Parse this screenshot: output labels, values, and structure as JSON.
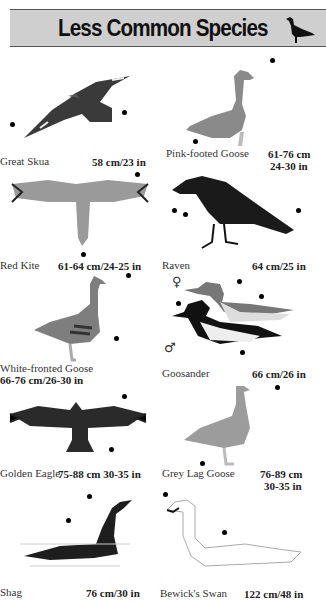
{
  "header": {
    "title": "Less Common Species",
    "icon": "goose-silhouette-icon",
    "background": "#cfcfcf"
  },
  "species": [
    {
      "name": "Great Skua",
      "size": "58 cm/23 in"
    },
    {
      "name": "Pink-footed Goose",
      "size_line1": "61-76 cm",
      "size_line2": "24-30 in"
    },
    {
      "name": "Red Kite",
      "size": "61-64 cm/24-25 in"
    },
    {
      "name": "Raven",
      "size": "64 cm/25 in"
    },
    {
      "name": "White-fronted Goose",
      "size": "66-76 cm/26-30 in"
    },
    {
      "name": "Goosander",
      "size": "66 cm/26 in",
      "female_symbol": "♀",
      "male_symbol": "♂"
    },
    {
      "name": "Golden Eagle",
      "size": "75-88 cm 30-35 in"
    },
    {
      "name": "Grey Lag Goose",
      "size_line1": "76-89 cm",
      "size_line2": "30-35 in"
    },
    {
      "name": "Shag",
      "size": "76 cm/30 in"
    },
    {
      "name": "Bewick's Swan",
      "size": "122 cm/48 in"
    }
  ]
}
